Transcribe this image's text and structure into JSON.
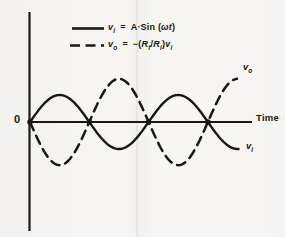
{
  "figure": {
    "ink_color": "#1b1713",
    "origin_label": "0",
    "time_label": "Time",
    "curve_labels": {
      "output": {
        "base": "v",
        "sub": "o"
      },
      "input": {
        "base": "v",
        "sub": "i"
      }
    },
    "legend": {
      "row1": {
        "var": "v",
        "var_sub": "i",
        "equals": "=",
        "rhs_pre": "A·Sin (",
        "rhs_var": "ωt",
        "rhs_post": ")"
      },
      "row2": {
        "var": "v",
        "var_sub": "o",
        "equals": "=",
        "rhs_pre": "−(",
        "r1": "R",
        "r1_sub": "f",
        "slash": "/",
        "r2": "R",
        "r2_sub": "i",
        "rhs_close": ")",
        "v2": "v",
        "v2_sub": "i"
      }
    }
  },
  "chart_data": {
    "type": "line",
    "xlabel": "Time",
    "ylabel": "",
    "origin_label": "0",
    "legend_entries": [
      "v_i = A·Sin (ωt)",
      "v_o = −(R_f/R_i)v_i"
    ],
    "series": [
      {
        "name": "vi",
        "label": "v_i",
        "style": "solid",
        "amplitude": 1.0,
        "phase_deg": 0,
        "cycles": 1.77
      },
      {
        "name": "vo",
        "label": "v_o",
        "style": "dashed",
        "amplitude": 1.6,
        "phase_deg": 180,
        "cycles": 1.75
      }
    ],
    "x_quarter_cycles": [
      0,
      0.25,
      0.5,
      0.75,
      1.0,
      1.25,
      1.5,
      1.75
    ],
    "vi_over_A": [
      0,
      1,
      0,
      -1,
      0,
      1,
      0,
      -1
    ],
    "vo_over_A": [
      0,
      -1.6,
      0,
      1.6,
      0,
      -1.6,
      0,
      1.6
    ],
    "zero_crossings_marked": 4,
    "grid": false,
    "legend_position": "top-center"
  }
}
